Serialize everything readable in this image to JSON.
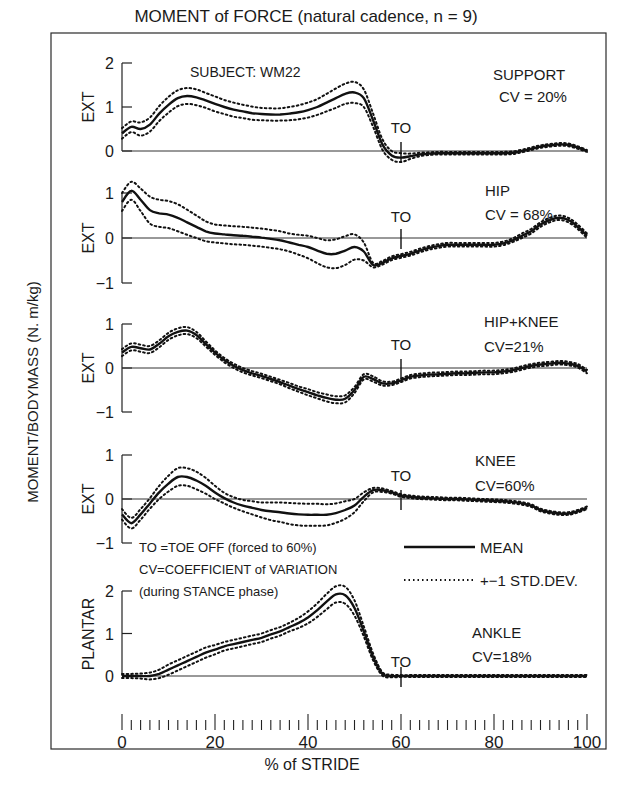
{
  "chart_data": {
    "type": "line",
    "title": "MOMENT of FORCE (natural cadence, n = 9)",
    "xlabel": "% of STRIDE",
    "ylabel": "MOMENT/BODYMASS (N. m/kg)",
    "xlim": [
      0,
      100
    ],
    "x_ticks": [
      0,
      20,
      40,
      60,
      80,
      100
    ],
    "x_minor_tick_step": 2,
    "subject": "SUBJECT: WM22",
    "toe_off_pct": 60,
    "toe_off_label": "TO",
    "notes": [
      "TO =TOE OFF (forced to 60%)",
      "CV=COEFFICIENT of VARIATION",
      "(during STANCE phase)"
    ],
    "legend": [
      {
        "label": "MEAN",
        "style": "solid"
      },
      {
        "label": "+−1 STD.DEV.",
        "style": "dotted"
      }
    ],
    "x": [
      0,
      2,
      4,
      6,
      8,
      10,
      12,
      14,
      16,
      18,
      20,
      22,
      24,
      26,
      28,
      30,
      32,
      34,
      36,
      38,
      40,
      42,
      44,
      46,
      48,
      50,
      52,
      54,
      56,
      58,
      60,
      62,
      64,
      66,
      68,
      70,
      72,
      74,
      76,
      78,
      80,
      82,
      84,
      86,
      88,
      90,
      92,
      94,
      96,
      98,
      100
    ],
    "panels": [
      {
        "name": "SUPPORT",
        "cv": "CV = 20%",
        "axis_label": "EXT",
        "ylim": [
          0,
          2
        ],
        "y_ticks": [
          0,
          1,
          2
        ],
        "mean": [
          0.4,
          0.55,
          0.5,
          0.6,
          0.85,
          1.05,
          1.2,
          1.25,
          1.22,
          1.15,
          1.07,
          1.0,
          0.94,
          0.9,
          0.86,
          0.84,
          0.83,
          0.83,
          0.85,
          0.88,
          0.93,
          1.0,
          1.1,
          1.2,
          1.3,
          1.33,
          1.2,
          0.7,
          0.15,
          -0.1,
          -0.15,
          -0.12,
          -0.08,
          -0.06,
          -0.05,
          -0.05,
          -0.05,
          -0.05,
          -0.05,
          -0.05,
          -0.05,
          -0.05,
          -0.04,
          0.0,
          0.05,
          0.1,
          0.13,
          0.15,
          0.14,
          0.08,
          0.0
        ],
        "sd": [
          0.12,
          0.12,
          0.15,
          0.16,
          0.17,
          0.18,
          0.18,
          0.18,
          0.18,
          0.17,
          0.17,
          0.16,
          0.16,
          0.15,
          0.15,
          0.14,
          0.14,
          0.14,
          0.15,
          0.16,
          0.17,
          0.18,
          0.2,
          0.22,
          0.23,
          0.24,
          0.2,
          0.15,
          0.12,
          0.1,
          0.1,
          0.06,
          0.04,
          0.03,
          0.03,
          0.03,
          0.03,
          0.03,
          0.03,
          0.03,
          0.03,
          0.03,
          0.03,
          0.03,
          0.03,
          0.03,
          0.03,
          0.03,
          0.03,
          0.03,
          0.02
        ]
      },
      {
        "name": "HIP",
        "cv": "CV = 68%",
        "axis_label": "EXT",
        "ylim": [
          -1,
          1
        ],
        "y_ticks": [
          -1,
          0,
          1
        ],
        "mean": [
          0.8,
          1.05,
          0.85,
          0.62,
          0.55,
          0.52,
          0.45,
          0.35,
          0.25,
          0.15,
          0.1,
          0.08,
          0.06,
          0.05,
          0.03,
          0.01,
          -0.02,
          -0.05,
          -0.1,
          -0.15,
          -0.2,
          -0.28,
          -0.35,
          -0.35,
          -0.28,
          -0.2,
          -0.3,
          -0.6,
          -0.55,
          -0.45,
          -0.4,
          -0.35,
          -0.28,
          -0.22,
          -0.18,
          -0.15,
          -0.15,
          -0.15,
          -0.15,
          -0.15,
          -0.15,
          -0.12,
          -0.05,
          0.05,
          0.15,
          0.3,
          0.4,
          0.45,
          0.4,
          0.25,
          0.05
        ],
        "sd": [
          0.2,
          0.2,
          0.25,
          0.3,
          0.3,
          0.3,
          0.3,
          0.28,
          0.25,
          0.22,
          0.2,
          0.2,
          0.2,
          0.2,
          0.2,
          0.2,
          0.2,
          0.2,
          0.2,
          0.22,
          0.25,
          0.28,
          0.3,
          0.32,
          0.32,
          0.28,
          0.2,
          0.05,
          0.04,
          0.04,
          0.04,
          0.04,
          0.04,
          0.04,
          0.04,
          0.04,
          0.04,
          0.04,
          0.04,
          0.04,
          0.04,
          0.04,
          0.04,
          0.05,
          0.05,
          0.05,
          0.05,
          0.05,
          0.05,
          0.05,
          0.05
        ]
      },
      {
        "name": "HIP+KNEE",
        "cv": "CV=21%",
        "axis_label": "EXT",
        "ylim": [
          -1,
          1
        ],
        "y_ticks": [
          -1,
          0,
          1
        ],
        "mean": [
          0.35,
          0.48,
          0.45,
          0.42,
          0.55,
          0.72,
          0.82,
          0.85,
          0.75,
          0.55,
          0.35,
          0.18,
          0.05,
          -0.05,
          -0.12,
          -0.18,
          -0.25,
          -0.32,
          -0.4,
          -0.48,
          -0.55,
          -0.62,
          -0.68,
          -0.72,
          -0.7,
          -0.5,
          -0.2,
          -0.25,
          -0.35,
          -0.35,
          -0.28,
          -0.2,
          -0.17,
          -0.15,
          -0.14,
          -0.13,
          -0.12,
          -0.12,
          -0.11,
          -0.1,
          -0.1,
          -0.08,
          -0.05,
          0.0,
          0.05,
          0.08,
          0.1,
          0.12,
          0.1,
          0.05,
          -0.08
        ],
        "sd": [
          0.08,
          0.08,
          0.08,
          0.08,
          0.08,
          0.08,
          0.08,
          0.08,
          0.07,
          0.06,
          0.05,
          0.05,
          0.05,
          0.05,
          0.05,
          0.05,
          0.05,
          0.05,
          0.06,
          0.06,
          0.07,
          0.07,
          0.08,
          0.08,
          0.08,
          0.07,
          0.06,
          0.06,
          0.05,
          0.04,
          0.04,
          0.04,
          0.04,
          0.04,
          0.04,
          0.04,
          0.04,
          0.04,
          0.04,
          0.04,
          0.04,
          0.04,
          0.04,
          0.04,
          0.04,
          0.04,
          0.04,
          0.04,
          0.04,
          0.04,
          0.04
        ]
      },
      {
        "name": "KNEE",
        "cv": "CV=60%",
        "axis_label": "EXT",
        "ylim": [
          -1,
          1
        ],
        "y_ticks": [
          -1,
          0,
          1
        ],
        "mean": [
          -0.35,
          -0.55,
          -0.35,
          -0.1,
          0.15,
          0.35,
          0.5,
          0.5,
          0.42,
          0.3,
          0.15,
          0.02,
          -0.08,
          -0.15,
          -0.2,
          -0.25,
          -0.28,
          -0.3,
          -0.33,
          -0.35,
          -0.36,
          -0.36,
          -0.36,
          -0.32,
          -0.25,
          -0.15,
          0.05,
          0.2,
          0.2,
          0.15,
          0.08,
          0.05,
          0.03,
          0.02,
          0.01,
          0.0,
          0.0,
          -0.01,
          -0.02,
          -0.03,
          -0.04,
          -0.05,
          -0.07,
          -0.1,
          -0.15,
          -0.25,
          -0.3,
          -0.33,
          -0.33,
          -0.28,
          -0.2
        ],
        "sd": [
          0.12,
          0.12,
          0.12,
          0.12,
          0.15,
          0.18,
          0.2,
          0.2,
          0.2,
          0.18,
          0.15,
          0.12,
          0.12,
          0.13,
          0.15,
          0.17,
          0.2,
          0.22,
          0.24,
          0.25,
          0.25,
          0.25,
          0.24,
          0.22,
          0.2,
          0.15,
          0.1,
          0.05,
          0.04,
          0.03,
          0.03,
          0.03,
          0.03,
          0.03,
          0.03,
          0.03,
          0.03,
          0.03,
          0.03,
          0.03,
          0.03,
          0.03,
          0.03,
          0.03,
          0.03,
          0.03,
          0.03,
          0.03,
          0.03,
          0.03,
          0.03
        ]
      },
      {
        "name": "ANKLE",
        "cv": "CV=18%",
        "axis_label": "PLANTAR",
        "ylim": [
          0,
          2
        ],
        "y_ticks": [
          0,
          1,
          2
        ],
        "mean": [
          0.0,
          0.0,
          0.0,
          0.0,
          0.05,
          0.15,
          0.25,
          0.35,
          0.45,
          0.55,
          0.62,
          0.7,
          0.75,
          0.8,
          0.85,
          0.9,
          0.98,
          1.05,
          1.15,
          1.25,
          1.38,
          1.55,
          1.75,
          1.92,
          1.9,
          1.6,
          1.05,
          0.45,
          0.05,
          0.0,
          0.0,
          0.0,
          0.0,
          0.0,
          0.0,
          0.0,
          0.0,
          0.0,
          0.0,
          0.0,
          0.0,
          0.0,
          0.0,
          0.0,
          0.0,
          0.0,
          0.0,
          0.0,
          0.0,
          0.0,
          0.0
        ],
        "sd": [
          0.05,
          0.05,
          0.06,
          0.08,
          0.1,
          0.12,
          0.12,
          0.12,
          0.12,
          0.12,
          0.11,
          0.1,
          0.1,
          0.1,
          0.1,
          0.1,
          0.1,
          0.1,
          0.1,
          0.12,
          0.14,
          0.16,
          0.18,
          0.19,
          0.2,
          0.18,
          0.12,
          0.08,
          0.04,
          0.03,
          0.02,
          0.02,
          0.02,
          0.02,
          0.02,
          0.02,
          0.02,
          0.02,
          0.02,
          0.02,
          0.02,
          0.02,
          0.02,
          0.02,
          0.02,
          0.02,
          0.02,
          0.02,
          0.02,
          0.02,
          0.02
        ]
      }
    ]
  }
}
